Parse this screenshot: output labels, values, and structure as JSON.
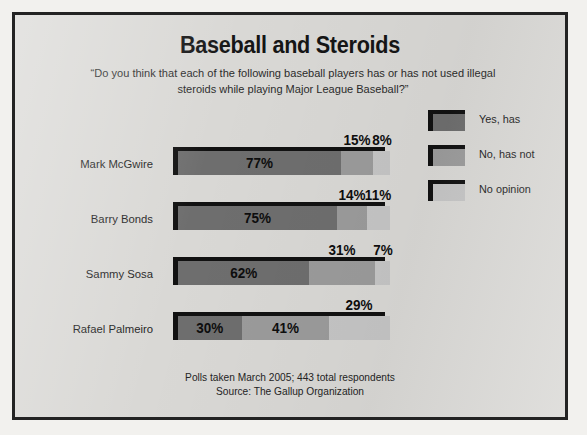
{
  "chart_data": {
    "type": "bar",
    "orientation": "horizontal",
    "stacked": true,
    "title": "Baseball and Steroids",
    "subtitle": "“Do you think that each of the following baseball players has or has not used illegal steroids while playing Major League Baseball?”",
    "xlabel": "",
    "ylabel": "",
    "xlim": [
      0,
      100
    ],
    "grid": false,
    "legend_position": "top-right",
    "categories": [
      "Mark McGwire",
      "Barry Bonds",
      "Sammy Sosa",
      "Rafael Palmeiro"
    ],
    "series": [
      {
        "name": "Yes, has",
        "color": "#6e6e6e",
        "values": [
          77,
          75,
          62,
          30
        ]
      },
      {
        "name": "No, has not",
        "color": "#9b9b9b",
        "values": [
          15,
          14,
          31,
          41
        ]
      },
      {
        "name": "No opinion",
        "color": "#c5c5c5",
        "values": [
          8,
          11,
          7,
          29
        ]
      }
    ],
    "value_labels": [
      [
        "77%",
        "15%",
        "8%"
      ],
      [
        "75%",
        "14%",
        "11%"
      ],
      [
        "62%",
        "31%",
        "7%"
      ],
      [
        "30%",
        "41%",
        "29%"
      ]
    ],
    "annotations": [
      "Polls taken March 2005; 443 total respondents",
      "Source: The Gallup Organization"
    ],
    "source": "The Gallup Organization",
    "poll_date": "March 2005",
    "total_respondents": 443
  },
  "legend": {
    "items": [
      {
        "label": "Yes, has",
        "swatch": "sw-yes"
      },
      {
        "label": "No, has not",
        "swatch": "sw-no"
      },
      {
        "label": "No opinion",
        "swatch": "sw-none"
      }
    ]
  },
  "footer": {
    "line1": "Polls taken March 2005; 443 total respondents",
    "line2": "Source: The Gallup Organization"
  },
  "colors": {
    "panel_background": "#d9d8d5",
    "page_background": "#f2f1ee",
    "frame_border": "#232323",
    "bar_yes": "#6e6e6e",
    "bar_no": "#9b9b9b",
    "bar_none": "#c5c5c5",
    "bar_edge": "#111111",
    "text": "#1d1d1d"
  }
}
